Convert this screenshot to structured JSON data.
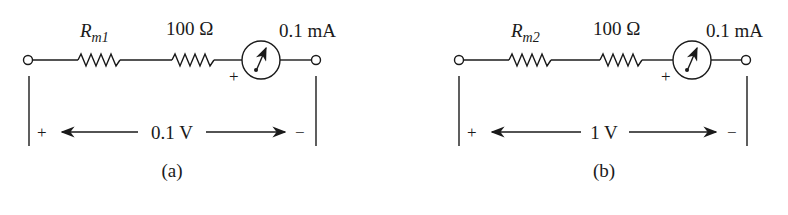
{
  "colors": {
    "ink": "#1a1a1a",
    "background": "#ffffff"
  },
  "circuits": [
    {
      "id": "a",
      "caption": "(a)",
      "resistor1": {
        "symbol": "R",
        "subscript": "m1"
      },
      "resistor2": {
        "label": "100 Ω"
      },
      "meter": {
        "label": "0.1 mA",
        "polarity": "+"
      },
      "voltage": {
        "label": "0.1 V",
        "plus": "+",
        "minus": "−"
      }
    },
    {
      "id": "b",
      "caption": "(b)",
      "resistor1": {
        "symbol": "R",
        "subscript": "m2"
      },
      "resistor2": {
        "label": "100 Ω"
      },
      "meter": {
        "label": "0.1 mA",
        "polarity": "+"
      },
      "voltage": {
        "label": "1 V",
        "plus": "+",
        "minus": "−"
      }
    }
  ]
}
